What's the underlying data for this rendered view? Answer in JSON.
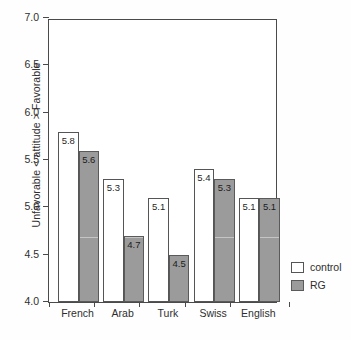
{
  "chart_data": {
    "type": "bar",
    "title": "",
    "xlabel": "",
    "ylabel": "Unfavorable < attitude > Favorable",
    "ylim": [
      4.0,
      7.0
    ],
    "yticks": [
      "4.0",
      "4.5",
      "5.0",
      "5.5",
      "6.0",
      "6.5",
      "7.0"
    ],
    "grid": false,
    "legend_position": "bottom-right",
    "categories": [
      "French",
      "Arab",
      "Turk",
      "Swiss",
      "English"
    ],
    "series": [
      {
        "name": "control",
        "color": "#ffffff",
        "values": [
          5.8,
          5.3,
          5.1,
          5.4,
          5.1
        ],
        "labels": [
          "5.8",
          "5.3",
          "5.1",
          "5.4",
          "5.1"
        ]
      },
      {
        "name": "RG",
        "color": "#9b9b9b",
        "values": [
          5.6,
          4.7,
          4.5,
          5.3,
          5.1
        ],
        "labels": [
          "5.6",
          "4.7",
          "4.5",
          "5.3",
          "5.1"
        ]
      }
    ]
  },
  "legend": {
    "items": [
      {
        "label": "control",
        "swatch": "white-square-icon"
      },
      {
        "label": "RG",
        "swatch": "gray-square-icon"
      }
    ]
  }
}
